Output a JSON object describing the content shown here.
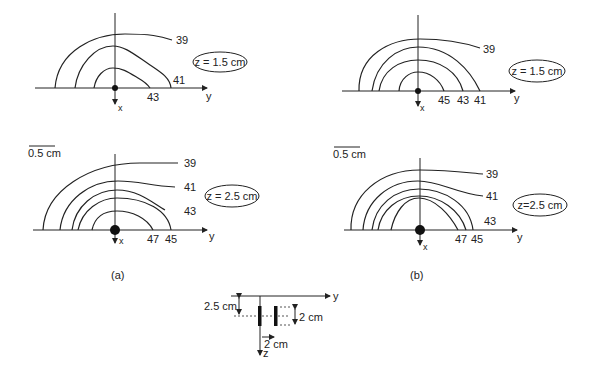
{
  "panels": {
    "a_top": {
      "z_label": "z = 1.5 cm",
      "axis_y": "y",
      "axis_x": "x",
      "isotherms": [
        "39",
        "41",
        "43"
      ]
    },
    "b_top": {
      "z_label": "z = 1.5 cm",
      "axis_y": "y",
      "axis_x": "x",
      "isotherms": [
        "39",
        "45",
        "43",
        "41"
      ]
    },
    "a_bottom": {
      "scale": "0.5 cm",
      "z_label": "z = 2.5 cm",
      "axis_y": "y",
      "axis_x": "x",
      "isotherms": [
        "39",
        "41",
        "43",
        "47",
        "45"
      ]
    },
    "b_bottom": {
      "scale": "0.5 cm",
      "z_label": "z=2.5 cm",
      "axis_y": "y",
      "axis_x": "x",
      "isotherms": [
        "39",
        "41",
        "43",
        "47",
        "45"
      ]
    }
  },
  "captions": {
    "a": "(a)",
    "b": "(b)"
  },
  "geometry": {
    "axis_y": "y",
    "axis_z": "z",
    "depth": "2.5 cm",
    "length": "2 cm",
    "spacing": "2 cm"
  }
}
